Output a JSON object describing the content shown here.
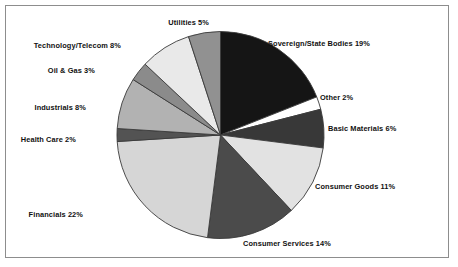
{
  "figure": {
    "title": "",
    "border_color": "#8d8d8d",
    "background": "#ffffff"
  },
  "chart_data": {
    "type": "pie",
    "title": "",
    "xlabel": "",
    "ylabel": "",
    "legend_position": "none",
    "grid": false,
    "start_angle_deg": 0,
    "direction": "clockwise",
    "units": "percent",
    "total": 100,
    "categories": [
      "Sovereign/State Bodies",
      "Other",
      "Basic Materials",
      "Consumer Goods",
      "Consumer Services",
      "Financials",
      "Health Care",
      "Industrials",
      "Oil & Gas",
      "Technology/Telecom",
      "Utilities"
    ],
    "values": [
      19,
      2,
      6,
      11,
      14,
      22,
      2,
      8,
      3,
      8,
      5
    ],
    "colors": [
      "#151515",
      "#ffffff",
      "#383838",
      "#e2e2e2",
      "#4b4b4b",
      "#d6d6d6",
      "#535353",
      "#b2b2b2",
      "#8b8b8b",
      "#e9e9e9",
      "#919191"
    ],
    "slice_edge_color": "#3a3a3a",
    "labels": [
      "Sovereign/State Bodies 19%",
      "Other 2%",
      "Basic Materials 6%",
      "Consumer Goods 11%",
      "Consumer Services 14%",
      "Financials 22%",
      "Health Care 2%",
      "Industrials 8%",
      "Oil & Gas 3%",
      "Technology/Telecom 8%",
      "Utilities 5%"
    ]
  },
  "labels": {
    "sovereign": "Sovereign/State Bodies 19%",
    "other": "Other 2%",
    "basic_materials": "Basic Materials 6%",
    "consumer_goods": "Consumer Goods 11%",
    "consumer_services": "Consumer Services 14%",
    "financials": "Financials 22%",
    "health_care": "Health Care 2%",
    "industrials": "Industrials 8%",
    "oil_gas": "Oil & Gas 3%",
    "technology_telecom": "Technology/Telecom 8%",
    "utilities": "Utilities 5%"
  }
}
